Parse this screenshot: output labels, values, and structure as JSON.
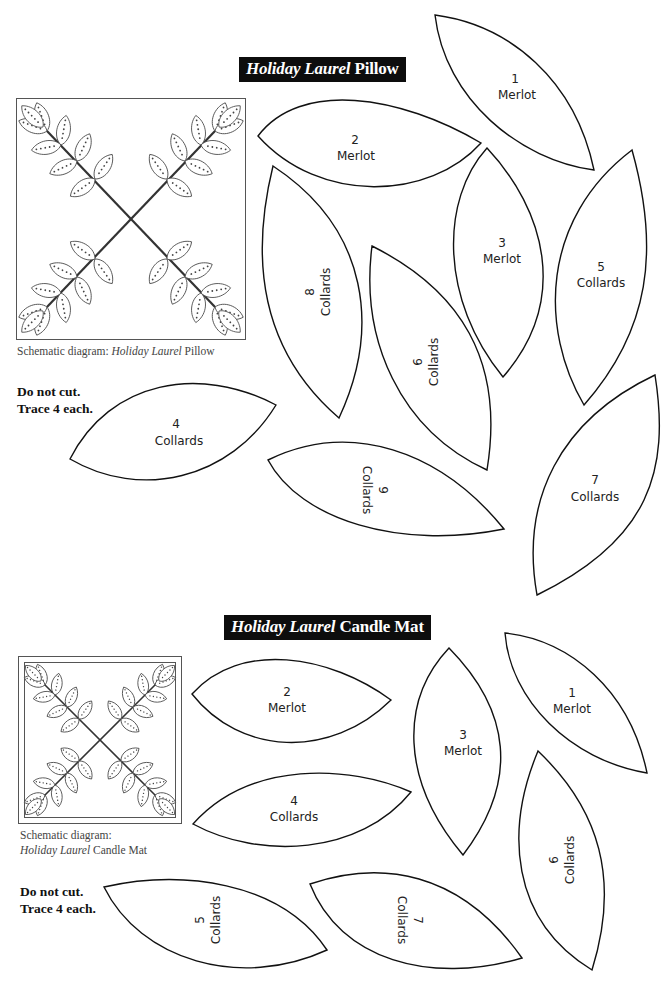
{
  "pillow": {
    "title_italic": "Holiday Laurel",
    "title_plain": "Pillow",
    "schematic_caption_plain": "Schematic diagram: ",
    "schematic_caption_italic": "Holiday Laurel",
    "schematic_caption_suffix": " Pillow",
    "note_line1": "Do not cut.",
    "note_line2": "Trace 4 each.",
    "pieces": [
      {
        "number": "1",
        "fabric": "Merlot"
      },
      {
        "number": "2",
        "fabric": "Merlot"
      },
      {
        "number": "3",
        "fabric": "Merlot"
      },
      {
        "number": "4",
        "fabric": "Collards"
      },
      {
        "number": "5",
        "fabric": "Collards"
      },
      {
        "number": "6",
        "fabric": "Collards"
      },
      {
        "number": "7",
        "fabric": "Collards"
      },
      {
        "number": "8",
        "fabric": "Collards"
      },
      {
        "number": "9",
        "fabric": "Collards"
      }
    ]
  },
  "candle_mat": {
    "title_italic": "Holiday Laurel",
    "title_plain": "Candle Mat",
    "schematic_caption_line1": "Schematic diagram:",
    "schematic_caption_italic": "Holiday Laurel",
    "schematic_caption_suffix": " Candle Mat",
    "note_line1": "Do not cut.",
    "note_line2": "Trace 4 each.",
    "pieces": [
      {
        "number": "1",
        "fabric": "Merlot"
      },
      {
        "number": "2",
        "fabric": "Merlot"
      },
      {
        "number": "3",
        "fabric": "Merlot"
      },
      {
        "number": "4",
        "fabric": "Collards"
      },
      {
        "number": "5",
        "fabric": "Collards"
      },
      {
        "number": "6",
        "fabric": "Collards"
      },
      {
        "number": "7",
        "fabric": "Collards"
      }
    ]
  }
}
